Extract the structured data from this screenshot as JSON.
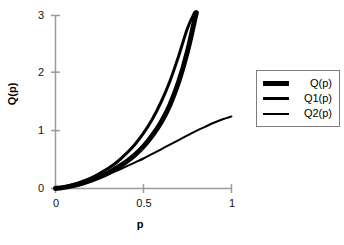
{
  "chart_data": {
    "type": "line",
    "title": "",
    "xlabel": "p",
    "ylabel": "Q(p)",
    "xlim": [
      0,
      1
    ],
    "ylim": [
      0,
      3
    ],
    "xticks": [
      "0",
      "0.5",
      "1"
    ],
    "xtick_values": [
      0,
      0.5,
      1
    ],
    "yticks": [
      "0",
      "1",
      "2",
      "3"
    ],
    "ytick_values": [
      0,
      1,
      2,
      3
    ],
    "grid": false,
    "legend_position": "right",
    "axis_color": "#9a9a9a",
    "series": [
      {
        "name": "Q(p)",
        "color": "#000000",
        "line_width": 5,
        "x": [
          0,
          0.05,
          0.1,
          0.15,
          0.2,
          0.25,
          0.3,
          0.35,
          0.4,
          0.45,
          0.5,
          0.55,
          0.6,
          0.65,
          0.7,
          0.75,
          0.8
        ],
        "y": [
          0,
          0.02,
          0.05,
          0.09,
          0.14,
          0.2,
          0.27,
          0.36,
          0.46,
          0.58,
          0.73,
          0.92,
          1.15,
          1.45,
          1.85,
          2.38,
          3.05
        ]
      },
      {
        "name": "Q1(p)",
        "color": "#000000",
        "line_width": 3,
        "x": [
          0,
          0.05,
          0.1,
          0.15,
          0.2,
          0.25,
          0.3,
          0.35,
          0.4,
          0.45,
          0.5,
          0.55,
          0.6,
          0.65,
          0.7,
          0.75,
          0.79
        ],
        "y": [
          0,
          0.03,
          0.07,
          0.12,
          0.18,
          0.26,
          0.35,
          0.46,
          0.6,
          0.76,
          0.96,
          1.2,
          1.5,
          1.86,
          2.3,
          2.78,
          3.05
        ]
      },
      {
        "name": "Q2(p)",
        "color": "#000000",
        "line_width": 2,
        "x": [
          0,
          0.05,
          0.1,
          0.15,
          0.2,
          0.25,
          0.3,
          0.35,
          0.4,
          0.45,
          0.5,
          0.55,
          0.6,
          0.65,
          0.7,
          0.75,
          0.8,
          0.85,
          0.9,
          0.95,
          1
        ],
        "y": [
          0,
          0.02,
          0.05,
          0.09,
          0.14,
          0.19,
          0.25,
          0.31,
          0.38,
          0.45,
          0.52,
          0.6,
          0.68,
          0.76,
          0.84,
          0.92,
          1.0,
          1.07,
          1.14,
          1.2,
          1.25
        ]
      }
    ]
  },
  "legend": {
    "items": [
      {
        "label": "Q(p)",
        "swatch": "thick-line-swatch"
      },
      {
        "label": "Q1(p)",
        "swatch": "medium-line-swatch"
      },
      {
        "label": "Q2(p)",
        "swatch": "thin-line-swatch"
      }
    ]
  },
  "axes": {
    "y_title": "Q(p)",
    "x_title": "p",
    "y_tick_0": "0",
    "y_tick_1": "1",
    "y_tick_2": "2",
    "y_tick_3": "3",
    "x_tick_0": "0",
    "x_tick_1": "0.5",
    "x_tick_2": "1"
  }
}
